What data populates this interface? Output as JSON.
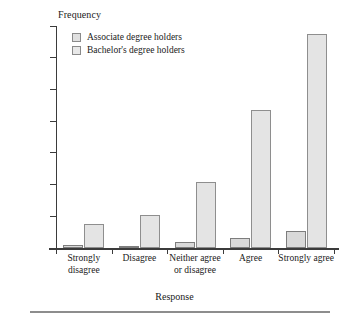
{
  "chart_data": {
    "type": "bar",
    "title": "",
    "xlabel": "Response",
    "ylabel": "Frequency",
    "categories": [
      "Strongly disagree",
      "Disagree",
      "Neither agree or disagree",
      "Agree",
      "Strongly agree"
    ],
    "category_lines": [
      [
        "Strongly",
        "disagree"
      ],
      [
        "Disagree"
      ],
      [
        "Neither agree",
        "or disagree"
      ],
      [
        "Agree"
      ],
      [
        "Strongly agree"
      ]
    ],
    "series": [
      {
        "name": "Associate degree holders",
        "color": "#d9d9d9",
        "values": [
          200,
          150,
          400,
          600,
          1100
        ]
      },
      {
        "name": "Bachelor's degree holders",
        "color": "#e4e4e4",
        "values": [
          1500,
          2100,
          4150,
          8700,
          13500
        ]
      }
    ],
    "ylim": [
      0,
      14000
    ],
    "yticks": [
      0,
      2000,
      4000,
      6000,
      8000,
      10000,
      12000,
      14000
    ],
    "ytick_labels": [
      "0",
      "2,000",
      "4,000",
      "6,000",
      "8,000",
      "10,000",
      "12,000",
      "14,000"
    ],
    "grid": false,
    "legend_position": "top-left"
  },
  "legend": {
    "items": [
      {
        "label": "Associate degree holders"
      },
      {
        "label": "Bachelor's degree holders"
      }
    ]
  }
}
